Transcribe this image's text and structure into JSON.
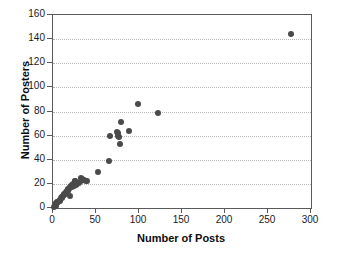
{
  "chart_data": {
    "type": "scatter",
    "title": "",
    "xlabel": "Number of Posts",
    "ylabel": "Number of Posters",
    "xlim": [
      0,
      300
    ],
    "ylim": [
      0,
      160
    ],
    "xticks": [
      0,
      50,
      100,
      150,
      200,
      250,
      300
    ],
    "yticks": [
      0,
      20,
      40,
      60,
      80,
      100,
      120,
      140,
      160
    ],
    "grid": "horizontal-dotted",
    "legend": "none",
    "marker_color": "#4a4a4a",
    "marker_size_px": 6,
    "points": [
      {
        "x": 1,
        "y": 1
      },
      {
        "x": 2,
        "y": 2
      },
      {
        "x": 3,
        "y": 2
      },
      {
        "x": 3,
        "y": 3
      },
      {
        "x": 4,
        "y": 4
      },
      {
        "x": 5,
        "y": 4
      },
      {
        "x": 5,
        "y": 5
      },
      {
        "x": 6,
        "y": 5
      },
      {
        "x": 7,
        "y": 6
      },
      {
        "x": 8,
        "y": 6
      },
      {
        "x": 8,
        "y": 7
      },
      {
        "x": 9,
        "y": 8
      },
      {
        "x": 10,
        "y": 8
      },
      {
        "x": 10,
        "y": 9
      },
      {
        "x": 11,
        "y": 9
      },
      {
        "x": 12,
        "y": 10
      },
      {
        "x": 13,
        "y": 11
      },
      {
        "x": 13,
        "y": 12
      },
      {
        "x": 14,
        "y": 12
      },
      {
        "x": 15,
        "y": 13
      },
      {
        "x": 16,
        "y": 13
      },
      {
        "x": 16,
        "y": 14
      },
      {
        "x": 17,
        "y": 15
      },
      {
        "x": 18,
        "y": 14
      },
      {
        "x": 18,
        "y": 16
      },
      {
        "x": 19,
        "y": 16
      },
      {
        "x": 20,
        "y": 17
      },
      {
        "x": 20,
        "y": 10
      },
      {
        "x": 21,
        "y": 18
      },
      {
        "x": 22,
        "y": 17
      },
      {
        "x": 22,
        "y": 19
      },
      {
        "x": 23,
        "y": 20
      },
      {
        "x": 24,
        "y": 18
      },
      {
        "x": 25,
        "y": 22
      },
      {
        "x": 26,
        "y": 22
      },
      {
        "x": 27,
        "y": 19
      },
      {
        "x": 28,
        "y": 20
      },
      {
        "x": 30,
        "y": 21
      },
      {
        "x": 32,
        "y": 22
      },
      {
        "x": 33,
        "y": 25
      },
      {
        "x": 34,
        "y": 24
      },
      {
        "x": 35,
        "y": 23
      },
      {
        "x": 36,
        "y": 23
      },
      {
        "x": 38,
        "y": 22
      },
      {
        "x": 40,
        "y": 22
      },
      {
        "x": 52,
        "y": 30
      },
      {
        "x": 65,
        "y": 39
      },
      {
        "x": 66,
        "y": 60
      },
      {
        "x": 74,
        "y": 63
      },
      {
        "x": 76,
        "y": 60
      },
      {
        "x": 76,
        "y": 62
      },
      {
        "x": 77,
        "y": 59
      },
      {
        "x": 78,
        "y": 53
      },
      {
        "x": 79,
        "y": 71
      },
      {
        "x": 88,
        "y": 64
      },
      {
        "x": 99,
        "y": 86
      },
      {
        "x": 122,
        "y": 79
      },
      {
        "x": 277,
        "y": 144
      }
    ]
  }
}
